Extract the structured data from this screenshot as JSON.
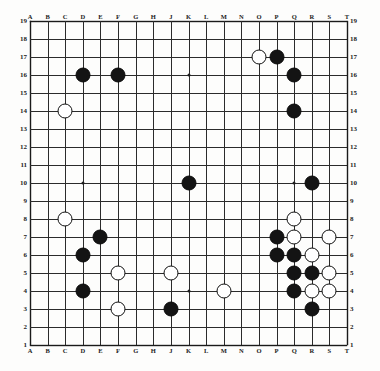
{
  "diagram": {
    "kind": "go-board",
    "board_size": 19,
    "background_color": "#fdfdfc",
    "line_color": "#2b2b2b",
    "black_stone_color": "#141414",
    "white_stone_color": "#ffffff",
    "white_stone_border_color": "#111111"
  },
  "axes": {
    "columns": [
      "A",
      "B",
      "C",
      "D",
      "E",
      "F",
      "G",
      "H",
      "J",
      "K",
      "L",
      "M",
      "N",
      "O",
      "P",
      "Q",
      "R",
      "S",
      "T"
    ],
    "rows_top_to_bottom": [
      "19",
      "18",
      "17",
      "16",
      "15",
      "14",
      "13",
      "12",
      "11",
      "10",
      "9",
      "8",
      "7",
      "6",
      "5",
      "4",
      "3",
      "2",
      "1"
    ],
    "column_labels_top": [
      "A",
      "B",
      "C",
      "D",
      "E",
      "F",
      "G",
      "H",
      "J",
      "K",
      "L",
      "M",
      "N",
      "O",
      "P",
      "Q",
      "R",
      "S",
      "T"
    ],
    "column_labels_bottom": [
      "A",
      "B",
      "C",
      "D",
      "E",
      "F",
      "G",
      "H",
      "J",
      "K",
      "L",
      "M",
      "N",
      "O",
      "P",
      "Q",
      "R",
      "S",
      "T"
    ],
    "row_labels_left": [
      "19",
      "18",
      "17",
      "16",
      "15",
      "14",
      "13",
      "12",
      "11",
      "10",
      "9",
      "8",
      "7",
      "6",
      "5",
      "4",
      "3",
      "2",
      "1"
    ],
    "row_labels_right": [
      "19",
      "18",
      "17",
      "16",
      "15",
      "14",
      "13",
      "12",
      "11",
      "10",
      "9",
      "8",
      "7",
      "6",
      "5",
      "4",
      "3",
      "2",
      "1"
    ]
  },
  "star_points": [
    {
      "col": "D",
      "row": 16
    },
    {
      "col": "K",
      "row": 16
    },
    {
      "col": "Q",
      "row": 16
    },
    {
      "col": "D",
      "row": 10
    },
    {
      "col": "K",
      "row": 10
    },
    {
      "col": "Q",
      "row": 10
    },
    {
      "col": "D",
      "row": 4
    },
    {
      "col": "K",
      "row": 4
    },
    {
      "col": "Q",
      "row": 4
    }
  ],
  "stones": {
    "black": [
      {
        "col": "P",
        "row": 17
      },
      {
        "col": "D",
        "row": 16
      },
      {
        "col": "F",
        "row": 16
      },
      {
        "col": "Q",
        "row": 16
      },
      {
        "col": "Q",
        "row": 14
      },
      {
        "col": "K",
        "row": 10
      },
      {
        "col": "R",
        "row": 10
      },
      {
        "col": "E",
        "row": 7
      },
      {
        "col": "P",
        "row": 7
      },
      {
        "col": "D",
        "row": 6
      },
      {
        "col": "P",
        "row": 6
      },
      {
        "col": "Q",
        "row": 6
      },
      {
        "col": "Q",
        "row": 5
      },
      {
        "col": "R",
        "row": 5
      },
      {
        "col": "D",
        "row": 4
      },
      {
        "col": "Q",
        "row": 4
      },
      {
        "col": "J",
        "row": 3
      },
      {
        "col": "R",
        "row": 3
      }
    ],
    "white": [
      {
        "col": "O",
        "row": 17
      },
      {
        "col": "C",
        "row": 14
      },
      {
        "col": "C",
        "row": 8
      },
      {
        "col": "Q",
        "row": 8
      },
      {
        "col": "Q",
        "row": 7
      },
      {
        "col": "S",
        "row": 7
      },
      {
        "col": "R",
        "row": 6
      },
      {
        "col": "F",
        "row": 5
      },
      {
        "col": "J",
        "row": 5
      },
      {
        "col": "S",
        "row": 5
      },
      {
        "col": "M",
        "row": 4
      },
      {
        "col": "R",
        "row": 4
      },
      {
        "col": "S",
        "row": 4
      },
      {
        "col": "F",
        "row": 3
      }
    ]
  },
  "counts": {
    "black_stone_count": "18",
    "white_stone_count": "14"
  }
}
